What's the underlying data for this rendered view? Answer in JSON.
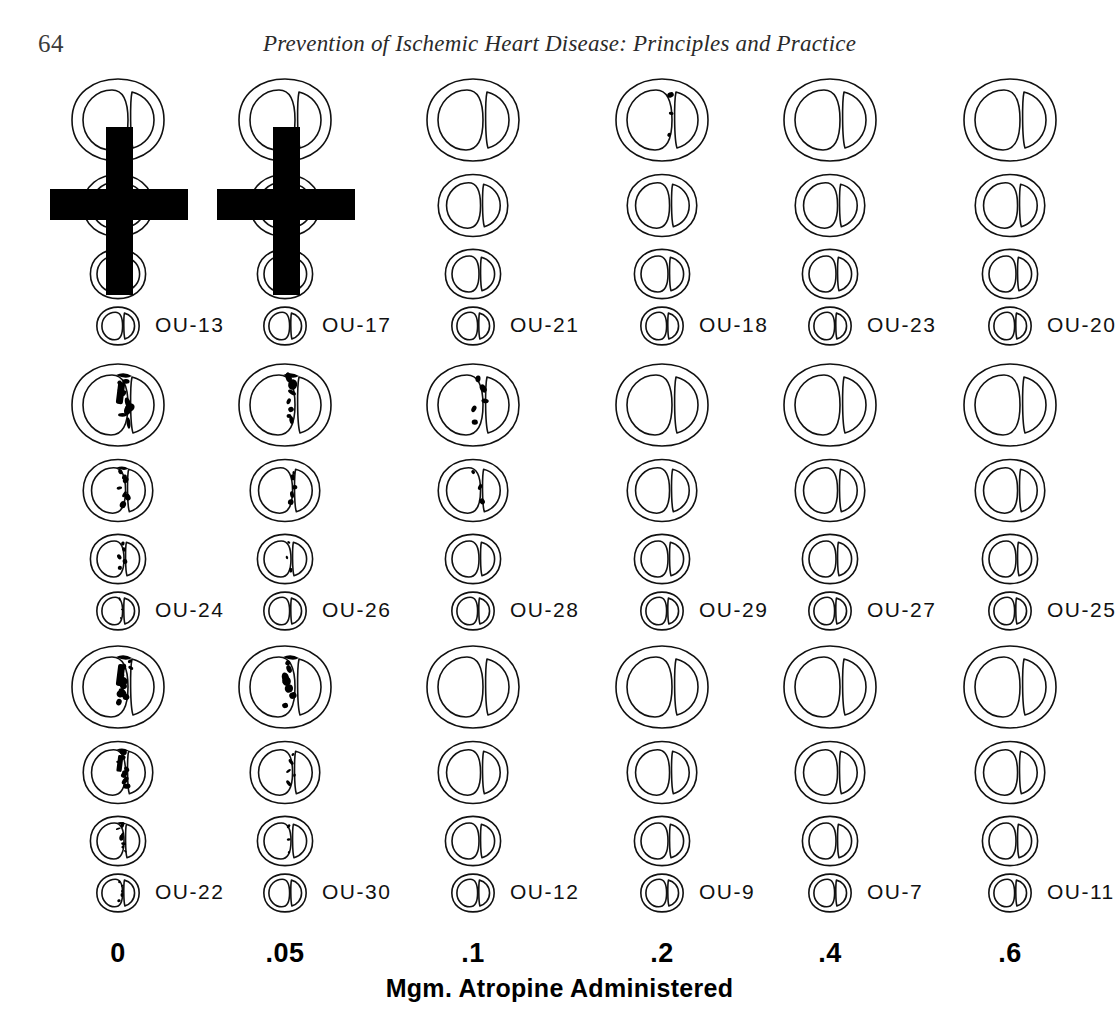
{
  "page": {
    "folio": "64",
    "running_title": "Prevention of Ischemic Heart Disease: Principles and Practice"
  },
  "axis": {
    "title": "Mgm. Atropine Administered",
    "dose_labels": [
      "0",
      ".05",
      ".1",
      ".2",
      ".4",
      ".6"
    ]
  },
  "figure": {
    "columns": [
      {
        "dose": "0",
        "center_x": 118
      },
      {
        "dose": ".05",
        "center_x": 285
      },
      {
        "dose": ".1",
        "center_x": 473
      },
      {
        "dose": ".2",
        "center_x": 662
      },
      {
        "dose": ".4",
        "center_x": 830
      },
      {
        "dose": ".6",
        "center_x": 1010
      }
    ],
    "rows": [
      {
        "row_index": 1,
        "cases": [
          {
            "label": "OU-13",
            "column": 0,
            "crossed_out": true,
            "lesion_level": 0
          },
          {
            "label": "OU-17",
            "column": 1,
            "crossed_out": true,
            "lesion_level": 0
          },
          {
            "label": "OU-21",
            "column": 2,
            "crossed_out": false,
            "lesion_level": 0
          },
          {
            "label": "OU-18",
            "column": 3,
            "crossed_out": false,
            "lesion_level": 1
          },
          {
            "label": "OU-23",
            "column": 4,
            "crossed_out": false,
            "lesion_level": 0
          },
          {
            "label": "OU-20",
            "column": 5,
            "crossed_out": false,
            "lesion_level": 0
          }
        ]
      },
      {
        "row_index": 2,
        "cases": [
          {
            "label": "OU-24",
            "column": 0,
            "crossed_out": false,
            "lesion_level": 4
          },
          {
            "label": "OU-26",
            "column": 1,
            "crossed_out": false,
            "lesion_level": 3
          },
          {
            "label": "OU-28",
            "column": 2,
            "crossed_out": false,
            "lesion_level": 2
          },
          {
            "label": "OU-29",
            "column": 3,
            "crossed_out": false,
            "lesion_level": 0
          },
          {
            "label": "OU-27",
            "column": 4,
            "crossed_out": false,
            "lesion_level": 0
          },
          {
            "label": "OU-25",
            "column": 5,
            "crossed_out": false,
            "lesion_level": 0
          }
        ]
      },
      {
        "row_index": 3,
        "cases": [
          {
            "label": "OU-22",
            "column": 0,
            "crossed_out": false,
            "lesion_level": 5
          },
          {
            "label": "OU-30",
            "column": 1,
            "crossed_out": false,
            "lesion_level": 3
          },
          {
            "label": "OU-12",
            "column": 2,
            "crossed_out": false,
            "lesion_level": 0
          },
          {
            "label": "OU-9",
            "column": 3,
            "crossed_out": false,
            "lesion_level": 0
          },
          {
            "label": "OU-7",
            "column": 4,
            "crossed_out": false,
            "lesion_level": 0
          },
          {
            "label": "OU-11",
            "column": 5,
            "crossed_out": false,
            "lesion_level": 0
          }
        ]
      }
    ],
    "slices_per_case": 4,
    "slice_scales": [
      1.0,
      0.76,
      0.6,
      0.46
    ]
  },
  "chart_data": {
    "type": "table",
    "xlabel": "Mgm. Atropine Administered",
    "ylabel": "",
    "categories": [
      "0",
      ".05",
      ".1",
      ".2",
      ".4",
      ".6"
    ],
    "legend": [],
    "grid": false,
    "series": [
      {
        "name": "Row 1",
        "cases": [
          "OU-13",
          "OU-17",
          "OU-21",
          "OU-18",
          "OU-23",
          "OU-20"
        ],
        "lesion_extent": [
          0,
          0,
          0,
          1,
          0,
          0
        ],
        "excluded": [
          true,
          true,
          false,
          false,
          false,
          false
        ]
      },
      {
        "name": "Row 2",
        "cases": [
          "OU-24",
          "OU-26",
          "OU-28",
          "OU-29",
          "OU-27",
          "OU-25"
        ],
        "lesion_extent": [
          4,
          3,
          2,
          0,
          0,
          0
        ],
        "excluded": [
          false,
          false,
          false,
          false,
          false,
          false
        ]
      },
      {
        "name": "Row 3",
        "cases": [
          "OU-22",
          "OU-30",
          "OU-12",
          "OU-9",
          "OU-7",
          "OU-11"
        ],
        "lesion_extent": [
          5,
          3,
          0,
          0,
          0,
          0
        ],
        "excluded": [
          false,
          false,
          false,
          false,
          false,
          false
        ]
      }
    ]
  }
}
